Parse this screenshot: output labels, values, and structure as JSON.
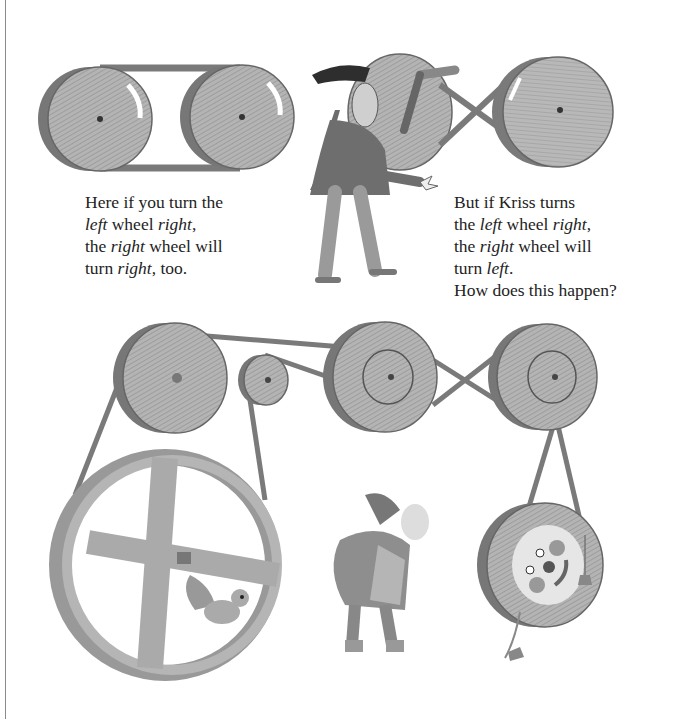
{
  "page": {
    "background": "#ffffff",
    "edge_color": "#8a8a8a"
  },
  "captions": {
    "left": {
      "lines": [
        [
          {
            "t": "Here if you turn the",
            "i": false
          }
        ],
        [
          {
            "t": "left",
            "i": true
          },
          {
            "t": " wheel ",
            "i": false
          },
          {
            "t": "right",
            "i": true
          },
          {
            "t": ",",
            "i": false
          }
        ],
        [
          {
            "t": "the ",
            "i": false
          },
          {
            "t": "right",
            "i": true
          },
          {
            "t": " wheel will",
            "i": false
          }
        ],
        [
          {
            "t": "turn ",
            "i": false
          },
          {
            "t": "right",
            "i": true
          },
          {
            "t": ", too.",
            "i": false
          }
        ]
      ]
    },
    "right": {
      "lines": [
        [
          {
            "t": "But if Kriss turns",
            "i": false
          }
        ],
        [
          {
            "t": "the ",
            "i": false
          },
          {
            "t": "left",
            "i": true
          },
          {
            "t": " wheel ",
            "i": false
          },
          {
            "t": "right",
            "i": true
          },
          {
            "t": ",",
            "i": false
          }
        ],
        [
          {
            "t": "the ",
            "i": false
          },
          {
            "t": "right",
            "i": true
          },
          {
            "t": " wheel will",
            "i": false
          }
        ],
        [
          {
            "t": "turn ",
            "i": false
          },
          {
            "t": "left",
            "i": true
          },
          {
            "t": ".",
            "i": false
          }
        ],
        [
          {
            "t": "How does this happen?",
            "i": false
          }
        ]
      ]
    }
  },
  "illustrations": {
    "top_left": {
      "name": "open-belt-pulleys",
      "wheels": 2,
      "belt": "parallel",
      "arrows": "clockwise"
    },
    "top_right": {
      "name": "crossed-belt-pulleys",
      "wheels": 2,
      "belt": "crossed",
      "character": "Kriss"
    },
    "bottom": {
      "name": "pulley-system",
      "wheels": 5,
      "extras": [
        "hamster-wheel-with-squirrel",
        "gnome",
        "face-wheel"
      ]
    }
  },
  "colors": {
    "wood": "#a9a9a9",
    "wood_dark": "#6e6e6e",
    "belt": "#7a7a7a",
    "ink": "#3a3a3a"
  }
}
